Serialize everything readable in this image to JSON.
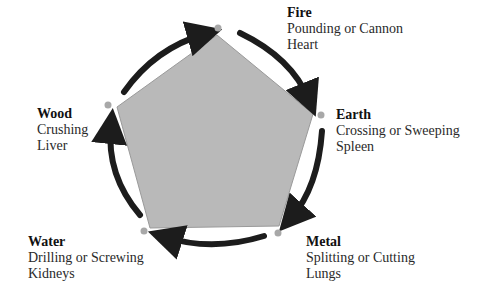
{
  "diagram": {
    "type": "five-element-cycle",
    "shape": "pentagon",
    "cycle_direction": "clockwise",
    "colors": {
      "pentagon_fill": "#b9b9b9",
      "pentagon_stroke": "#9a9a9a",
      "arrow": "#1c1c1c",
      "vertex_dot": "#a8a8a8",
      "text": "#2a2a2a"
    },
    "elements": [
      {
        "name": "Fire",
        "technique": "Pounding or Cannon",
        "organ": "Heart"
      },
      {
        "name": "Earth",
        "technique": "Crossing or Sweeping",
        "organ": "Spleen"
      },
      {
        "name": "Metal",
        "technique": "Splitting or Cutting",
        "organ": "Lungs"
      },
      {
        "name": "Water",
        "technique": "Drilling or Screwing",
        "organ": "Kidneys"
      },
      {
        "name": "Wood",
        "technique": "Crushing",
        "organ": "Liver"
      }
    ],
    "arrows": [
      {
        "from": "Wood",
        "to": "Fire"
      },
      {
        "from": "Fire",
        "to": "Earth"
      },
      {
        "from": "Earth",
        "to": "Metal"
      },
      {
        "from": "Metal",
        "to": "Water"
      },
      {
        "from": "Water",
        "to": "Wood"
      }
    ]
  }
}
